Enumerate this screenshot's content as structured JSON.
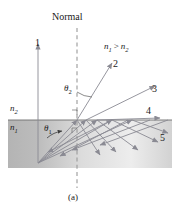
{
  "figure": {
    "caption": "(a)",
    "normal_label": "Normal",
    "media": {
      "upper_label": "n",
      "upper_sub": "2",
      "lower_label": "n",
      "lower_sub": "1"
    },
    "inequality": {
      "left": "n",
      "left_sub": "1",
      "operator": ">",
      "right": "n",
      "right_sub": "2"
    },
    "angles": {
      "incident": {
        "symbol": "θ",
        "sub": "1"
      },
      "refracted": {
        "symbol": "θ",
        "sub": "2"
      }
    },
    "ray_labels": [
      "1",
      "2",
      "3",
      "4",
      "5"
    ],
    "colors": {
      "ray": "#8a8a93",
      "medium_dark": "#b9b9b9",
      "medium_light": "#f2f2f2",
      "interface_line": "#6e6e6e",
      "normal_dashed": "#9a9a9a",
      "text": "#1a1a1a"
    }
  }
}
